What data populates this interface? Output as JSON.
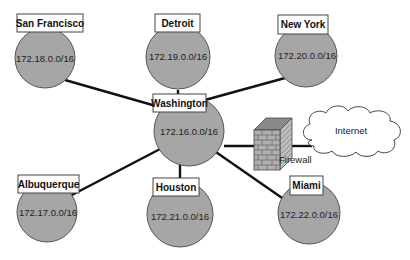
{
  "diagram": {
    "nodes": [
      {
        "id": "san-francisco",
        "label": "San Francisco",
        "network": "172.18.0.0/16"
      },
      {
        "id": "detroit",
        "label": "Detroit",
        "network": "172.19.0.0/16"
      },
      {
        "id": "new-york",
        "label": "New York",
        "network": "172.20.0.0/16"
      },
      {
        "id": "washington",
        "label": "Washington",
        "network": "172.16.0.0/16"
      },
      {
        "id": "albuquerque",
        "label": "Albuquerque",
        "network": "172.17.0.0/16"
      },
      {
        "id": "houston",
        "label": "Houston",
        "network": "172.21.0.0/16"
      },
      {
        "id": "miami",
        "label": "Miami",
        "network": "172.22.0.0/16"
      }
    ],
    "firewall": {
      "label": "Firewall"
    },
    "internet": {
      "label": "Internet"
    },
    "links": [
      [
        "washington",
        "san-francisco"
      ],
      [
        "washington",
        "detroit"
      ],
      [
        "washington",
        "new-york"
      ],
      [
        "washington",
        "albuquerque"
      ],
      [
        "washington",
        "houston"
      ],
      [
        "washington",
        "miami"
      ],
      [
        "washington",
        "firewall"
      ],
      [
        "firewall",
        "internet"
      ]
    ],
    "colors": {
      "node_fill": "#a6a6a6",
      "link": "#111111",
      "firewall_brick": "#9a9a9a"
    }
  }
}
